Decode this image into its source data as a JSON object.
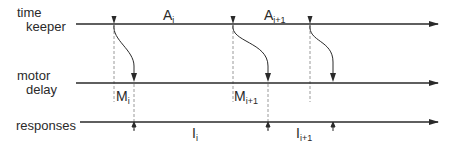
{
  "diagram": {
    "type": "timing-diagram",
    "rows": [
      {
        "id": "timekeeper",
        "label_lines": [
          "time",
          "keeper"
        ],
        "y": 24
      },
      {
        "id": "motor",
        "label_lines": [
          "motor",
          "delay"
        ],
        "y": 83
      },
      {
        "id": "responses",
        "label_lines": [
          "responses"
        ],
        "y": 122
      }
    ],
    "timeline": {
      "x_start": 76,
      "x_end": 438,
      "color": "#2a2a2a"
    },
    "events": [
      {
        "tk_x": 114,
        "resp_x": 134
      },
      {
        "tk_x": 233,
        "resp_x": 268
      },
      {
        "tk_x": 310,
        "resp_x": 333
      }
    ],
    "interval_labels": {
      "A": [
        {
          "base": "A",
          "sub": "i",
          "x": 163,
          "y": 20
        },
        {
          "base": "A",
          "sub": "i+1",
          "x": 264,
          "y": 20
        }
      ],
      "M": [
        {
          "base": "M",
          "sub": "i",
          "x": 116,
          "y": 101
        },
        {
          "base": "M",
          "sub": "i+1",
          "x": 234,
          "y": 101
        }
      ],
      "I": [
        {
          "base": "I",
          "sub": "i",
          "x": 192,
          "y": 138
        },
        {
          "base": "I",
          "sub": "i+1",
          "x": 296,
          "y": 138
        }
      ]
    },
    "colors": {
      "line": "#2a2a2a",
      "dashed": "#9a9a9a",
      "text": "#2a2a2a"
    }
  }
}
